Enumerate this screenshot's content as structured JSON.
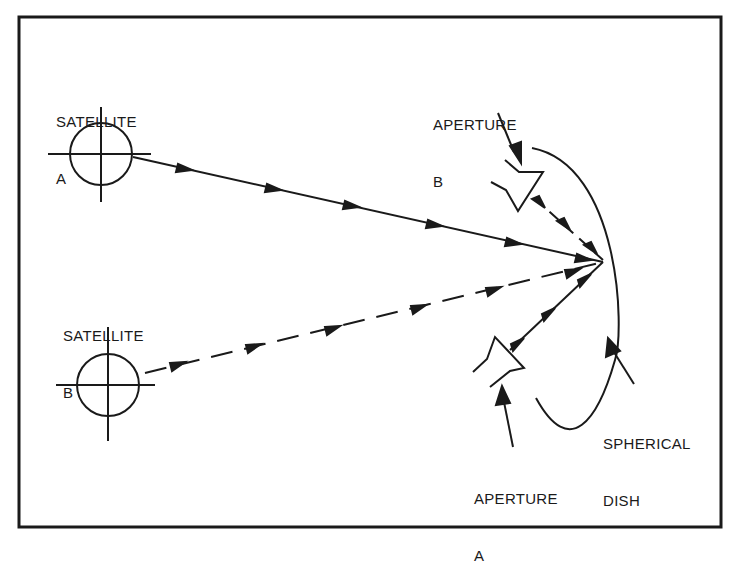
{
  "diagram": {
    "type": "satellite dual-feed spherical dish reflector schematic",
    "colors": {
      "ink": "#1a1a1a",
      "background": "#ffffff"
    },
    "labels": {
      "satellite_a": {
        "line1": "SATELLITE",
        "line2": "A"
      },
      "satellite_b": {
        "line1": "SATELLITE",
        "line2": "B"
      },
      "aperture_a": {
        "line1": "APERTURE",
        "line2": "A"
      },
      "aperture_b": {
        "line1": "APERTURE",
        "line2": "B"
      },
      "spherical_dish": {
        "line1": "SPHERICAL",
        "line2": "DISH"
      }
    },
    "elements": [
      {
        "id": "satellite-a",
        "kind": "crosshair-circle"
      },
      {
        "id": "satellite-b",
        "kind": "crosshair-circle"
      },
      {
        "id": "beam-a",
        "kind": "solid-line-with-arrows",
        "from": "satellite-a",
        "to": "spherical-dish",
        "reflects_to": "aperture-a"
      },
      {
        "id": "beam-b",
        "kind": "dashed-line-with-arrows",
        "from": "satellite-b",
        "to": "spherical-dish",
        "reflects_to": "aperture-b"
      },
      {
        "id": "spherical-dish",
        "kind": "arc"
      },
      {
        "id": "aperture-a",
        "kind": "horn-feed"
      },
      {
        "id": "aperture-b",
        "kind": "horn-feed"
      }
    ]
  }
}
